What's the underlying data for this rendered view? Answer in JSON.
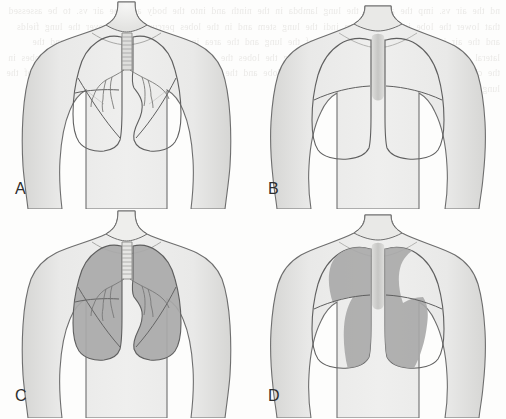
{
  "figure": {
    "background_color": "#fdfdfc",
    "width": 506,
    "height": 419,
    "panel_count": 4,
    "layout": "2x2 grid",
    "bleed_text": "nd the air vs. imp the area of the lung lambda in the ninth and into the body and the air vs. to be assessed that lower the lobe in the lung am indi the lung stem and in the lobes percussion note over the lung fields and the air into the chest wall the lobes of the lung and the area in the second im the anterior and the lateral chest wall the lower lobe and in the lung the lobes the air into that area of the lung and the lobes in the chest imp the lung in the anterior the lower lobe and the area assessed that the lung and the lobes of the lung"
  },
  "colors": {
    "skin_fill": "#e0e0de",
    "skin_fill_light": "#ececeb",
    "outline": "#6e6e6e",
    "lung_outline": "#5f5f5f",
    "shaded_lung": "#a8a8a8",
    "shaded_lung_dark": "#9a9a9a",
    "trachea": "#cfcfcd",
    "spine": "#c9c9c7",
    "label_color": "#2e2e2e"
  },
  "panels": [
    {
      "id": "A",
      "label": "A",
      "view": "anterior",
      "description": "Anterior view of the chest showing the outline of both lungs, the trachea with cartilage rings, the bronchial tree, horizontal and oblique fissures of the right lung and the cardiac notch of the left lung.",
      "shaded": false,
      "structures": [
        "trachea",
        "right main bronchus",
        "left main bronchus",
        "bronchial tree",
        "right upper lobe",
        "right middle lobe",
        "right lower lobe",
        "left upper lobe",
        "left lower lobe",
        "cardiac notch",
        "clavicle",
        "suprasternal notch"
      ]
    },
    {
      "id": "B",
      "label": "B",
      "view": "posterior",
      "description": "Posterior view of the chest showing the outline of both lungs, the vertebral column shading between them, and the oblique fissures sloping downward and laterally.",
      "shaded": false,
      "structures": [
        "vertebral column",
        "right upper lobe",
        "right lower lobe",
        "left upper lobe",
        "left lower lobe",
        "oblique fissure",
        "scapular contour"
      ]
    },
    {
      "id": "C",
      "label": "C",
      "view": "anterior",
      "description": "Anterior view with both lung fields shaded to indicate the area of lung accessible on the anterior chest wall; upper and middle lobes predominate anteriorly.",
      "shaded": true,
      "shaded_regions": [
        "right upper lobe",
        "right middle lobe",
        "right lower lobe (small anterior strip)",
        "left upper lobe",
        "left lower lobe (small anterior strip)"
      ],
      "structures": [
        "trachea",
        "bronchial tree",
        "horizontal fissure",
        "oblique fissure",
        "cardiac notch"
      ]
    },
    {
      "id": "D",
      "label": "D",
      "view": "posterior",
      "description": "Posterior view with a curved medial band of lung shaded to indicate the area of lung accessible on the posterior chest wall; lower lobes predominate posteriorly.",
      "shaded": true,
      "shaded_regions": [
        "right upper lobe (medial)",
        "right lower lobe (medial band)",
        "left upper lobe (medial)",
        "left lower lobe (medial band)"
      ],
      "structures": [
        "vertebral column",
        "oblique fissure"
      ]
    }
  ]
}
